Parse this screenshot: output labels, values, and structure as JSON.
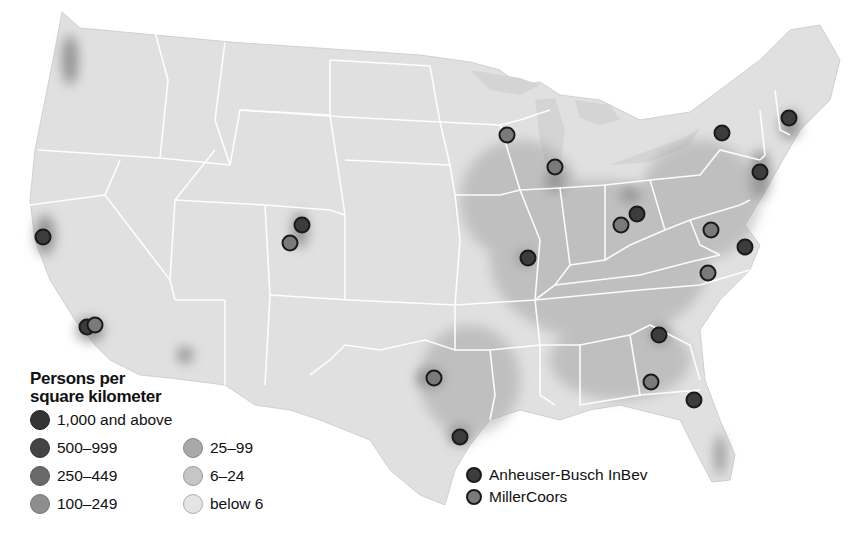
{
  "map": {
    "subject": "Contiguous United States population density with major brewery locations",
    "colors": {
      "background": "#ffffff",
      "land_base": "#e2e2e2",
      "state_border": "#ffffff",
      "water": "#d8d8d8"
    }
  },
  "density_legend": {
    "title_line1": "Persons per",
    "title_line2": "square kilometer",
    "items": [
      {
        "label": "1,000 and above",
        "color": "#333333"
      },
      {
        "label": "500–999",
        "color": "#444444"
      },
      {
        "label": "250–449",
        "color": "#6a6a6a"
      },
      {
        "label": "100–249",
        "color": "#8e8e8e"
      },
      {
        "label": "25–99",
        "color": "#a8a8a8"
      },
      {
        "label": "6–24",
        "color": "#c6c6c6"
      },
      {
        "label": "below 6",
        "color": "#e4e4e4"
      }
    ]
  },
  "brewery_legend": {
    "items": [
      {
        "label": "Anheuser-Busch InBev",
        "color": "#3c3c3c"
      },
      {
        "label": "MillerCoors",
        "color": "#7a7a7a"
      }
    ]
  },
  "breweries": [
    {
      "company": "ab",
      "x": 43,
      "y": 237
    },
    {
      "company": "ab",
      "x": 87,
      "y": 327
    },
    {
      "company": "mc",
      "x": 95,
      "y": 325
    },
    {
      "company": "ab",
      "x": 302,
      "y": 225
    },
    {
      "company": "mc",
      "x": 290,
      "y": 243
    },
    {
      "company": "mc",
      "x": 507,
      "y": 135
    },
    {
      "company": "mc",
      "x": 555,
      "y": 167
    },
    {
      "company": "ab",
      "x": 528,
      "y": 258
    },
    {
      "company": "mc",
      "x": 621,
      "y": 225
    },
    {
      "company": "ab",
      "x": 637,
      "y": 214
    },
    {
      "company": "ab",
      "x": 722,
      "y": 133
    },
    {
      "company": "ab",
      "x": 789,
      "y": 118
    },
    {
      "company": "ab",
      "x": 760,
      "y": 172
    },
    {
      "company": "mc",
      "x": 711,
      "y": 230
    },
    {
      "company": "ab",
      "x": 745,
      "y": 247
    },
    {
      "company": "mc",
      "x": 708,
      "y": 273
    },
    {
      "company": "mc",
      "x": 434,
      "y": 378
    },
    {
      "company": "ab",
      "x": 460,
      "y": 437
    },
    {
      "company": "ab",
      "x": 659,
      "y": 335
    },
    {
      "company": "mc",
      "x": 651,
      "y": 382
    },
    {
      "company": "ab",
      "x": 694,
      "y": 400
    }
  ]
}
